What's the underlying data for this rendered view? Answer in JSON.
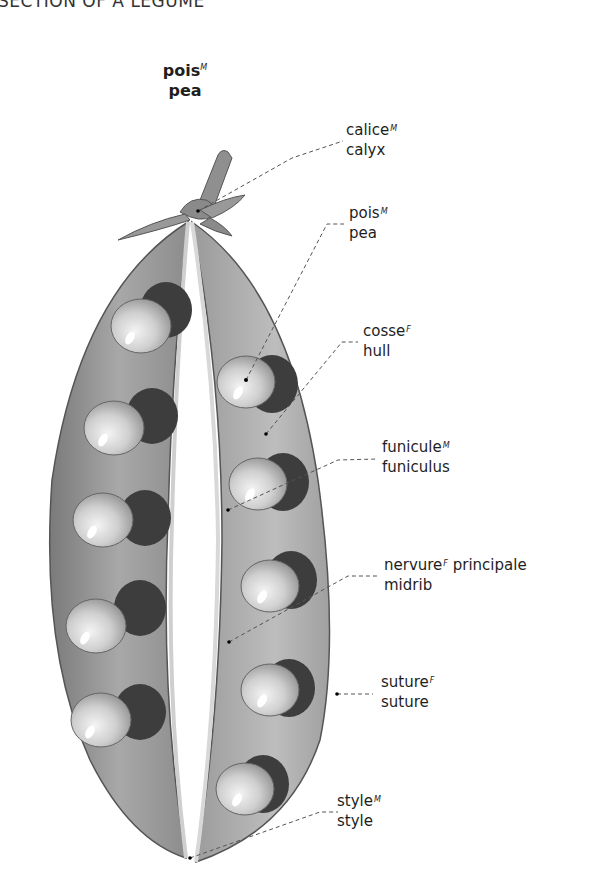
{
  "section_title": "SECTION OF A LEGUME",
  "main_term": {
    "fr": "pois",
    "fr_gender": "M",
    "en": "pea"
  },
  "labels": [
    {
      "id": "calyx",
      "fr": "calice",
      "gender": "M",
      "en": "calyx"
    },
    {
      "id": "pea",
      "fr": "pois",
      "gender": "M",
      "en": "pea"
    },
    {
      "id": "hull",
      "fr": "cosse",
      "gender": "F",
      "en": "hull"
    },
    {
      "id": "funiculus",
      "fr": "funicule",
      "gender": "M",
      "en": "funiculus"
    },
    {
      "id": "midrib",
      "fr": "nervure",
      "gender": "F",
      "fr_suffix": " principale",
      "en": "midrib"
    },
    {
      "id": "suture",
      "fr": "suture",
      "gender": "F",
      "en": "suture"
    },
    {
      "id": "style",
      "fr": "style",
      "gender": "M",
      "en": "style"
    }
  ],
  "colors": {
    "pod_fill": "#9a9a9a",
    "pod_inner": "#b5b5b5",
    "pea_fill": "#c8c8c8",
    "leader_line": "#555555"
  }
}
